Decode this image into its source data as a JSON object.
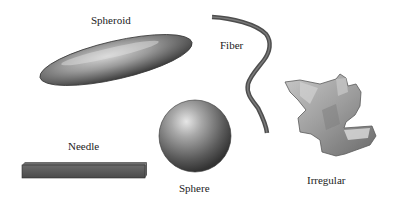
{
  "figure": {
    "shapes": [
      {
        "id": "spheroid",
        "label": "Spheroid"
      },
      {
        "id": "fiber",
        "label": "Fiber"
      },
      {
        "id": "needle",
        "label": "Needle"
      },
      {
        "id": "sphere",
        "label": "Sphere"
      },
      {
        "id": "irregular",
        "label": "Irregular"
      }
    ]
  },
  "colors": {
    "background": "#ffffff",
    "shape_fill_dark": "#4a4a4a",
    "shape_fill_mid": "#8a8a8a",
    "shape_highlight": "#d8d8d8",
    "needle_fill": "#3e3e3e",
    "fiber_stroke": "#555555",
    "label_text": "#222222"
  }
}
